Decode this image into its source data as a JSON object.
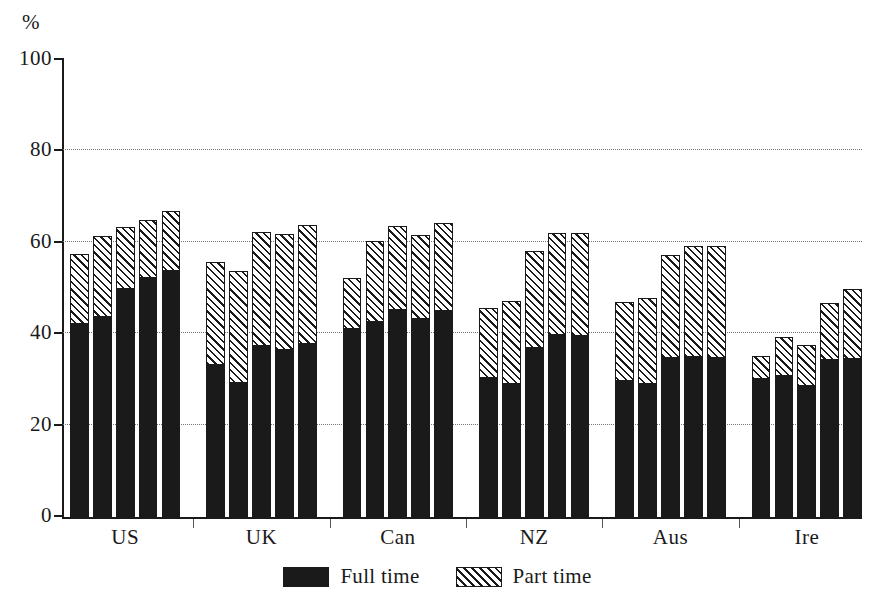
{
  "chart_data": {
    "type": "bar",
    "subtype": "stacked-grouped",
    "title": "",
    "xlabel": "",
    "ylabel": "%",
    "ylim": [
      0,
      100
    ],
    "ytick_labels": [
      "0",
      "20",
      "40",
      "60",
      "80",
      "100"
    ],
    "yticks": [
      0,
      20,
      40,
      60,
      80,
      100
    ],
    "grid": "horizontal-dotted",
    "gridlines": [
      20,
      40,
      60,
      80
    ],
    "legend_position": "bottom-center",
    "categories": [
      "US",
      "UK",
      "Can",
      "NZ",
      "Aus",
      "Ire"
    ],
    "bars_per_category": 5,
    "series": [
      {
        "name": "Full time",
        "color": "#1a1a1a",
        "fill": "solid"
      },
      {
        "name": "Part time",
        "color": "#1a1a1a",
        "fill": "diagonal-hatch"
      }
    ],
    "groups": [
      {
        "label": "US",
        "bars": [
          {
            "full_time": 43.0,
            "part_time": 15.0,
            "total": 58.0
          },
          {
            "full_time": 44.5,
            "part_time": 17.5,
            "total": 62.0
          },
          {
            "full_time": 50.5,
            "part_time": 13.5,
            "total": 64.0
          },
          {
            "full_time": 53.0,
            "part_time": 12.5,
            "total": 65.5
          },
          {
            "full_time": 54.5,
            "part_time": 13.0,
            "total": 67.5
          }
        ]
      },
      {
        "label": "UK",
        "bars": [
          {
            "full_time": 34.0,
            "part_time": 22.3,
            "total": 56.3
          },
          {
            "full_time": 30.0,
            "part_time": 24.3,
            "total": 54.3
          },
          {
            "full_time": 38.0,
            "part_time": 24.8,
            "total": 62.8
          },
          {
            "full_time": 37.3,
            "part_time": 25.1,
            "total": 62.4
          },
          {
            "full_time": 38.5,
            "part_time": 25.9,
            "total": 64.4
          }
        ]
      },
      {
        "label": "Can",
        "bars": [
          {
            "full_time": 41.8,
            "part_time": 11.0,
            "total": 52.8
          },
          {
            "full_time": 43.4,
            "part_time": 17.5,
            "total": 60.9
          },
          {
            "full_time": 46.0,
            "part_time": 18.2,
            "total": 64.2
          },
          {
            "full_time": 44.0,
            "part_time": 18.2,
            "total": 62.2
          },
          {
            "full_time": 45.8,
            "part_time": 19.0,
            "total": 64.8
          }
        ]
      },
      {
        "label": "NZ",
        "bars": [
          {
            "full_time": 31.1,
            "part_time": 15.1,
            "total": 46.2
          },
          {
            "full_time": 29.8,
            "part_time": 17.9,
            "total": 47.7
          },
          {
            "full_time": 37.7,
            "part_time": 21.0,
            "total": 58.7
          },
          {
            "full_time": 40.5,
            "part_time": 22.1,
            "total": 62.6
          },
          {
            "full_time": 40.3,
            "part_time": 22.3,
            "total": 62.6
          }
        ]
      },
      {
        "label": "Aus",
        "bars": [
          {
            "full_time": 30.4,
            "part_time": 17.1,
            "total": 47.5
          },
          {
            "full_time": 29.8,
            "part_time": 18.6,
            "total": 48.4
          },
          {
            "full_time": 35.5,
            "part_time": 22.3,
            "total": 57.8
          },
          {
            "full_time": 35.7,
            "part_time": 24.1,
            "total": 59.8
          },
          {
            "full_time": 35.5,
            "part_time": 24.3,
            "total": 59.8
          }
        ]
      },
      {
        "label": "Ire",
        "bars": [
          {
            "full_time": 30.9,
            "part_time": 4.8,
            "total": 35.7
          },
          {
            "full_time": 31.5,
            "part_time": 8.3,
            "total": 39.8
          },
          {
            "full_time": 29.3,
            "part_time": 8.8,
            "total": 38.1
          },
          {
            "full_time": 35.0,
            "part_time": 12.3,
            "total": 47.3
          },
          {
            "full_time": 35.3,
            "part_time": 15.1,
            "total": 50.4
          }
        ]
      }
    ]
  },
  "axis": {
    "unit_label": "%"
  },
  "legend": {
    "items": [
      {
        "label": "Full time",
        "fill": "solid"
      },
      {
        "label": "Part time",
        "fill": "hatch"
      }
    ]
  }
}
